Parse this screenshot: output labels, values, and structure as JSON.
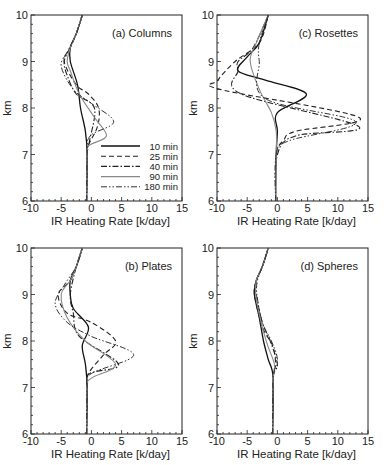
{
  "chart_data": [
    {
      "type": "line",
      "panel": "a",
      "title": "(a) Columns",
      "xlabel": "IR Heating Rate [k/day]",
      "ylabel": "km",
      "xlim": [
        -10,
        15
      ],
      "ylim": [
        6,
        10
      ],
      "xticks": [
        "-10",
        "-5",
        "0",
        "5",
        "10",
        "15"
      ],
      "yticks": [
        "6",
        "7",
        "8",
        "9",
        "10"
      ],
      "grid": false,
      "legend_position": "lower right",
      "series": [
        {
          "name": "10 min",
          "style": "solid",
          "points": [
            [
              -0.8,
              6
            ],
            [
              -0.7,
              7
            ],
            [
              -1,
              7.5
            ],
            [
              -1.8,
              8
            ],
            [
              -2.3,
              8.5
            ],
            [
              -3.5,
              9
            ],
            [
              -3.5,
              9.3
            ],
            [
              -2.5,
              9.6
            ],
            [
              -1.5,
              10
            ]
          ]
        },
        {
          "name": "25 min",
          "style": "dashed",
          "points": [
            [
              -0.8,
              6
            ],
            [
              -0.7,
              7
            ],
            [
              -0.5,
              7.2
            ],
            [
              1,
              7.6
            ],
            [
              1.2,
              8
            ],
            [
              -0.5,
              8.3
            ],
            [
              -2.5,
              8.5
            ],
            [
              -4.5,
              9
            ],
            [
              -3.5,
              9.3
            ],
            [
              -2.5,
              9.6
            ],
            [
              -1.5,
              10
            ]
          ]
        },
        {
          "name": "40 min",
          "style": "dashdot",
          "points": [
            [
              -0.8,
              6
            ],
            [
              -0.7,
              7
            ],
            [
              -0.3,
              7.3
            ],
            [
              0.5,
              8
            ],
            [
              -2.5,
              8.3
            ],
            [
              -4,
              8.7
            ],
            [
              -4.5,
              9
            ],
            [
              -3.5,
              9.3
            ],
            [
              -2.5,
              9.6
            ],
            [
              -1.5,
              10
            ]
          ]
        },
        {
          "name": "90 min",
          "style": "solid-gray",
          "points": [
            [
              -0.8,
              6
            ],
            [
              -0.7,
              7
            ],
            [
              -0.3,
              7.2
            ],
            [
              2.5,
              7.4
            ],
            [
              0.5,
              7.8
            ],
            [
              -2,
              8.3
            ],
            [
              -3.5,
              8.8
            ],
            [
              -4,
              9
            ],
            [
              -3.5,
              9.3
            ],
            [
              -2.5,
              9.6
            ],
            [
              -1.5,
              10
            ]
          ]
        },
        {
          "name": "180 min",
          "style": "dashdotdot",
          "points": [
            [
              -0.8,
              6
            ],
            [
              -0.7,
              7
            ],
            [
              -0.2,
              7.4
            ],
            [
              3.7,
              7.7
            ],
            [
              0,
              8.1
            ],
            [
              -3,
              8.4
            ],
            [
              -5,
              8.9
            ],
            [
              -4,
              9.2
            ],
            [
              -2.5,
              9.6
            ],
            [
              -1.5,
              10
            ]
          ]
        }
      ]
    },
    {
      "type": "line",
      "panel": "c",
      "title": "(c) Rosettes",
      "xlabel": "IR Heating Rate [k/day]",
      "ylabel": "km",
      "xlim": [
        -10,
        15
      ],
      "ylim": [
        6,
        10
      ],
      "xticks": [
        "-10",
        "-5",
        "0",
        "5",
        "10",
        "15"
      ],
      "yticks": [
        "6",
        "7",
        "8",
        "9",
        "10"
      ],
      "grid": false,
      "series": [
        {
          "name": "10 min",
          "style": "solid",
          "points": [
            [
              -0.3,
              6
            ],
            [
              -0.2,
              7
            ],
            [
              0,
              7.5
            ],
            [
              0,
              7.9
            ],
            [
              4.8,
              8.3
            ],
            [
              -2,
              8.6
            ],
            [
              -6.5,
              8.8
            ],
            [
              -5,
              9.1
            ],
            [
              -3,
              9.4
            ],
            [
              -1.5,
              10
            ]
          ]
        },
        {
          "name": "25 min",
          "style": "dashed",
          "points": [
            [
              -0.3,
              6
            ],
            [
              -0.2,
              7
            ],
            [
              1,
              7.3
            ],
            [
              3,
              7.5
            ],
            [
              13.5,
              7.8
            ],
            [
              -9.5,
              8.4
            ],
            [
              -9.8,
              8.6
            ],
            [
              -7,
              9.0
            ],
            [
              -3,
              9.4
            ],
            [
              -1.5,
              10
            ]
          ]
        },
        {
          "name": "40 min",
          "style": "dashdot",
          "points": [
            [
              -0.3,
              6
            ],
            [
              0,
              7
            ],
            [
              3,
              7.4
            ],
            [
              13.5,
              7.6
            ],
            [
              -6,
              8.3
            ],
            [
              -6.5,
              8.8
            ],
            [
              -6.5,
              9
            ],
            [
              -4,
              9.3
            ],
            [
              -1.5,
              10
            ]
          ]
        },
        {
          "name": "90 min",
          "style": "solid-gray",
          "points": [
            [
              -0.3,
              6
            ],
            [
              -0.2,
              7
            ],
            [
              -0.2,
              7.5
            ],
            [
              -1,
              7.9
            ],
            [
              -3,
              8.4
            ],
            [
              -4.5,
              9
            ],
            [
              -3.5,
              9.4
            ],
            [
              -1.5,
              10
            ]
          ]
        },
        {
          "name": "180 min",
          "style": "dashdotdot",
          "points": [
            [
              -0.3,
              6
            ],
            [
              -0.2,
              7
            ],
            [
              2,
              7.3
            ],
            [
              13,
              7.7
            ],
            [
              -2,
              8.2
            ],
            [
              -3,
              9
            ],
            [
              -3,
              9.4
            ],
            [
              -1.5,
              10
            ]
          ]
        }
      ]
    },
    {
      "type": "line",
      "panel": "b",
      "title": "(b) Plates",
      "xlabel": "IR Heating Rate [k/day]",
      "ylabel": "km",
      "xlim": [
        -10,
        15
      ],
      "ylim": [
        6,
        10
      ],
      "xticks": [
        "-10",
        "-5",
        "0",
        "5",
        "10",
        "15"
      ],
      "yticks": [
        "6",
        "7",
        "8",
        "9",
        "10"
      ],
      "grid": false,
      "series": [
        {
          "name": "10 min",
          "style": "solid",
          "points": [
            [
              -0.8,
              6
            ],
            [
              -0.7,
              7
            ],
            [
              -1,
              7.5
            ],
            [
              -1.5,
              7.9
            ],
            [
              -0.5,
              8.3
            ],
            [
              -3,
              8.7
            ],
            [
              -3.5,
              9
            ],
            [
              -3.5,
              9.3
            ],
            [
              -2.5,
              9.6
            ],
            [
              -1.5,
              10
            ]
          ]
        },
        {
          "name": "25 min",
          "style": "dashed",
          "points": [
            [
              -0.8,
              6
            ],
            [
              -0.7,
              7
            ],
            [
              -0.5,
              7.3
            ],
            [
              2,
              7.7
            ],
            [
              4,
              8
            ],
            [
              0,
              8.4
            ],
            [
              -4,
              8.6
            ],
            [
              -5.5,
              9.0
            ],
            [
              -3.5,
              9.3
            ],
            [
              -2.5,
              9.6
            ],
            [
              -1.5,
              10
            ]
          ]
        },
        {
          "name": "40 min",
          "style": "dashdot",
          "points": [
            [
              -0.8,
              6
            ],
            [
              -0.7,
              7
            ],
            [
              -0.3,
              7.3
            ],
            [
              4.5,
              7.5
            ],
            [
              -2,
              8.1
            ],
            [
              -3,
              8.6
            ],
            [
              -3.5,
              9.0
            ],
            [
              -2.5,
              9.6
            ],
            [
              -1.5,
              10
            ]
          ]
        },
        {
          "name": "90 min",
          "style": "solid-gray",
          "points": [
            [
              -0.8,
              6
            ],
            [
              -0.7,
              7
            ],
            [
              0,
              7.2
            ],
            [
              4,
              7.5
            ],
            [
              -1,
              8.0
            ],
            [
              -4,
              8.5
            ],
            [
              -5,
              9.0
            ],
            [
              -3.5,
              9.3
            ],
            [
              -2.5,
              9.6
            ],
            [
              -1.5,
              10
            ]
          ]
        },
        {
          "name": "180 min",
          "style": "dashdotdot",
          "points": [
            [
              -0.8,
              6
            ],
            [
              -0.7,
              7
            ],
            [
              0,
              7.3
            ],
            [
              7,
              7.7
            ],
            [
              0,
              8.1
            ],
            [
              -4,
              8.4
            ],
            [
              -6,
              8.8
            ],
            [
              -4.5,
              9.2
            ],
            [
              -2.5,
              9.6
            ],
            [
              -1.5,
              10
            ]
          ]
        }
      ]
    },
    {
      "type": "line",
      "panel": "d",
      "title": "(d) Spheres",
      "xlabel": "IR Heating Rate [k/day]",
      "ylabel": "km",
      "xlim": [
        -10,
        15
      ],
      "ylim": [
        6,
        10
      ],
      "xticks": [
        "-10",
        "-5",
        "0",
        "5",
        "10",
        "15"
      ],
      "yticks": [
        "6",
        "7",
        "8",
        "9",
        "10"
      ],
      "grid": false,
      "series": [
        {
          "name": "10 min",
          "style": "solid",
          "points": [
            [
              -0.8,
              6
            ],
            [
              -0.7,
              7.2
            ],
            [
              -1.5,
              7.6
            ],
            [
              -2.3,
              8
            ],
            [
              -3,
              8.5
            ],
            [
              -3.8,
              9
            ],
            [
              -3.5,
              9.3
            ],
            [
              -2.5,
              9.6
            ],
            [
              -1.5,
              10
            ]
          ]
        },
        {
          "name": "25 min",
          "style": "dashed",
          "points": [
            [
              -0.8,
              6
            ],
            [
              -0.7,
              7.2
            ],
            [
              -0.3,
              7.5
            ],
            [
              -0.8,
              7.9
            ],
            [
              -2.5,
              8.3
            ],
            [
              -3.8,
              9
            ],
            [
              -3.5,
              9.3
            ],
            [
              -2.5,
              9.6
            ],
            [
              -1.5,
              10
            ]
          ]
        },
        {
          "name": "40 min",
          "style": "dashdot",
          "points": [
            [
              -0.8,
              6
            ],
            [
              -0.7,
              7.2
            ],
            [
              0,
              7.5
            ],
            [
              -1.2,
              8
            ],
            [
              -2.5,
              8.4
            ],
            [
              -3.5,
              9
            ],
            [
              -3.5,
              9.3
            ],
            [
              -2.5,
              9.6
            ],
            [
              -1.5,
              10
            ]
          ]
        },
        {
          "name": "90 min",
          "style": "solid-gray",
          "points": [
            [
              -0.8,
              6
            ],
            [
              -0.7,
              7.2
            ],
            [
              -0.5,
              7.5
            ],
            [
              -1.6,
              7.9
            ],
            [
              -2.7,
              8.4
            ],
            [
              -3.6,
              9
            ],
            [
              -3.5,
              9.3
            ],
            [
              -2.5,
              9.6
            ],
            [
              -1.5,
              10
            ]
          ]
        },
        {
          "name": "180 min",
          "style": "dashdotdot",
          "points": [
            [
              -0.8,
              6
            ],
            [
              -0.7,
              7.2
            ],
            [
              0,
              7.6
            ],
            [
              -1,
              8
            ],
            [
              -2.5,
              8.4
            ],
            [
              -3.4,
              9
            ],
            [
              -3.3,
              9.3
            ],
            [
              -2.5,
              9.6
            ],
            [
              -1.5,
              10
            ]
          ]
        }
      ]
    }
  ],
  "legend": {
    "entries": [
      "10 min",
      "25 min",
      "40 min",
      "90 min",
      "180 min"
    ]
  },
  "labels": {
    "xlabel": "IR Heating Rate [k/day]",
    "ylabel": "km",
    "titles": [
      "(a) Columns",
      "(c) Rosettes",
      "(b) Plates",
      "(d) Spheres"
    ]
  }
}
